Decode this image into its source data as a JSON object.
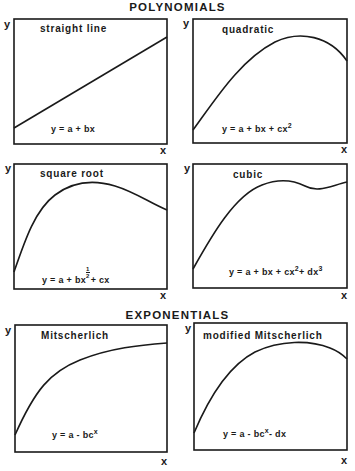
{
  "headings": {
    "polynomials": "POLYNOMIALS",
    "exponentials": "EXPONENTIALS"
  },
  "panels": [
    {
      "id": "straight-line",
      "title": "straight line",
      "equation": {
        "base": "y = a + bx",
        "parts": []
      },
      "y_label": "y",
      "x_label": "x",
      "shape": "linear increasing"
    },
    {
      "id": "quadratic",
      "title": "quadratic",
      "equation": {
        "base": "y = a + bx + cx",
        "sup": "2"
      },
      "y_label": "y",
      "x_label": "x",
      "shape": "rises to maximum then declines"
    },
    {
      "id": "square-root",
      "title": "square root",
      "equation": {
        "pre": "y = a + bx",
        "frac_num": "1",
        "frac_den": "2",
        "post": "+ cx"
      },
      "y_label": "y",
      "x_label": "x",
      "shape": "steep rise, broad maximum, gradual decline"
    },
    {
      "id": "cubic",
      "title": "cubic",
      "equation": {
        "pre": "y = a + bx + cx",
        "sup1": "2",
        "mid": "+ dx",
        "sup2": "3"
      },
      "y_label": "y",
      "x_label": "x",
      "shape": "rise, maximum, local minimum, rise again"
    },
    {
      "id": "mitscherlich",
      "title": "Mitscherlich",
      "equation": {
        "base": "y = a - bc",
        "sup": "x"
      },
      "y_label": "y",
      "x_label": "x",
      "shape": "asymptotic rise to plateau"
    },
    {
      "id": "modified-mitscherlich",
      "title": "modified Mitscherlich",
      "equation": {
        "base": "y = a - bc",
        "sup": "x",
        "post": "- dx"
      },
      "y_label": "y",
      "x_label": "x",
      "shape": "rise to maximum then slow decline"
    }
  ]
}
